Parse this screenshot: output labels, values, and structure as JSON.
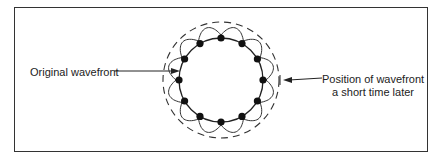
{
  "figure": {
    "type": "huygens-principle-wavefront",
    "labels": {
      "original": "Original wavefront",
      "later_line1": "Position of wavefront",
      "later_line2": "a short time later"
    },
    "geometry": {
      "center_x": 221,
      "center_y": 80,
      "original_radius": 42,
      "wavelet_radius": 50,
      "later_radius": 58,
      "point_source_count": 12
    },
    "colors": {
      "ink": "#222222",
      "background": "#ffffff",
      "frame": "#333333"
    }
  }
}
